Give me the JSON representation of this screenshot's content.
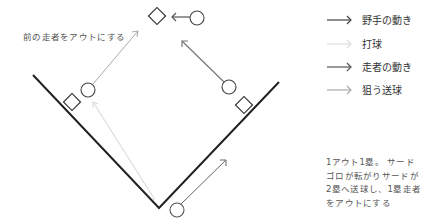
{
  "diagram": {
    "annotation": "前の走者をアウトにする",
    "colors": {
      "field_line": "#222222",
      "base_outline": "#333333",
      "player_outline": "#555555",
      "fielder_move": "#444444",
      "batted_ball": "#dddddd",
      "runner_move": "#777777",
      "target_throw": "#aaaaaa"
    },
    "players": [
      {
        "role": "runner-2b-approach",
        "x": 197,
        "y": 18
      },
      {
        "role": "third-baseman",
        "x": 88,
        "y": 90
      },
      {
        "role": "first-base-runner",
        "x": 229,
        "y": 87
      },
      {
        "role": "batter",
        "x": 177,
        "y": 210
      }
    ],
    "bases": [
      {
        "name": "second-base",
        "x": 157,
        "y": 16
      },
      {
        "name": "third-base",
        "x": 72,
        "y": 102
      },
      {
        "name": "first-base",
        "x": 244,
        "y": 105
      }
    ]
  },
  "legend": {
    "items": [
      {
        "label": "野手の動き",
        "color": "#444444"
      },
      {
        "label": "打球",
        "color": "#dddddd"
      },
      {
        "label": "走者の動き",
        "color": "#555555"
      },
      {
        "label": "狙う送球",
        "color": "#aaaaaa"
      }
    ]
  },
  "description": {
    "lines": [
      "1アウト1塁。 サード",
      "ゴロが転がりサードが",
      "2塁へ送球し、1塁走者",
      "をアウトにする"
    ]
  }
}
